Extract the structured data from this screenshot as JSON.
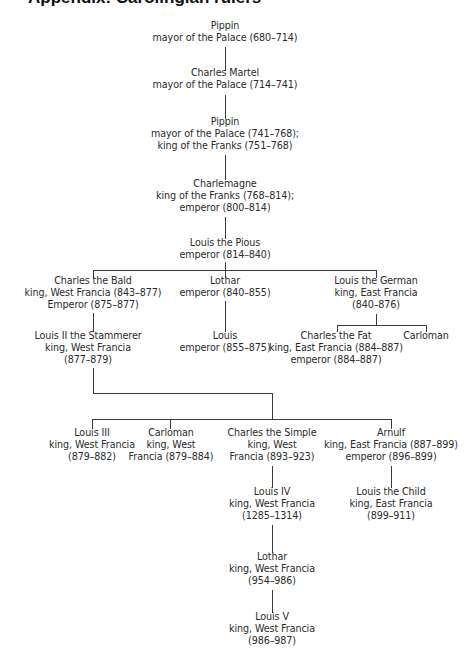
{
  "title": "Appendix: Carolingian rulers",
  "tree": {
    "pippin_1": {
      "name": "Pippin",
      "lines": [
        "mayor of the Palace (680–714)"
      ]
    },
    "charles_martel": {
      "name": "Charles Martel",
      "lines": [
        "mayor of the Palace (714–741)"
      ]
    },
    "pippin_2": {
      "name": "Pippin",
      "lines": [
        "mayor of the Palace (741–768);",
        "king of the Franks (751–768)"
      ]
    },
    "charlemagne": {
      "name": "Charlemagne",
      "lines": [
        "king of the Franks (768–814);",
        "emperor (800–814)"
      ]
    },
    "louis_pious": {
      "name": "Louis the Pious",
      "lines": [
        "emperor (814–840)"
      ]
    },
    "charles_bald": {
      "name": "Charles the Bald",
      "lines": [
        "king, West Francia (843–877)",
        "Emperor (875–877)"
      ]
    },
    "lothar_1": {
      "name": "Lothar",
      "lines": [
        "emperor (840–855)"
      ]
    },
    "louis_german": {
      "name": "Louis the German",
      "lines": [
        "king, East Francia",
        "(840–876)"
      ]
    },
    "louis_stammerer": {
      "name": "Louis II the Stammerer",
      "lines": [
        "king, West Francia",
        "(877–879)"
      ]
    },
    "louis_emperor": {
      "name": "Louis",
      "lines": [
        "emperor (855–875)"
      ]
    },
    "charles_fat": {
      "name": "Charles the Fat",
      "lines": [
        "king, East Francia (884–887)",
        "emperor (884–887)"
      ]
    },
    "carloman_1": {
      "name": "Carloman",
      "lines": []
    },
    "louis_3": {
      "name": "Louis III",
      "lines": [
        "king, West Francia",
        "(879–882)"
      ]
    },
    "carloman_2": {
      "name": "Carloman",
      "lines": [
        "king, West",
        "Francia (879–884)"
      ]
    },
    "charles_simple": {
      "name": "Charles the Simple",
      "lines": [
        "king, West",
        "Francia (893–923)"
      ]
    },
    "arnulf": {
      "name": "Arnulf",
      "lines": [
        "king, East Francia (887–899)",
        "emperor (896–899)"
      ]
    },
    "louis_4": {
      "name": "Louis IV",
      "lines": [
        "king, West Francia",
        "(1285–1314)"
      ]
    },
    "louis_child": {
      "name": "Louis the Child",
      "lines": [
        "king, East Francia",
        "(899–911)"
      ]
    },
    "lothar_2": {
      "name": "Lothar",
      "lines": [
        "king, West Francia",
        "(954–986)"
      ]
    },
    "louis_5": {
      "name": "Louis V",
      "lines": [
        "king, West Francia",
        "(986–987)"
      ]
    }
  }
}
